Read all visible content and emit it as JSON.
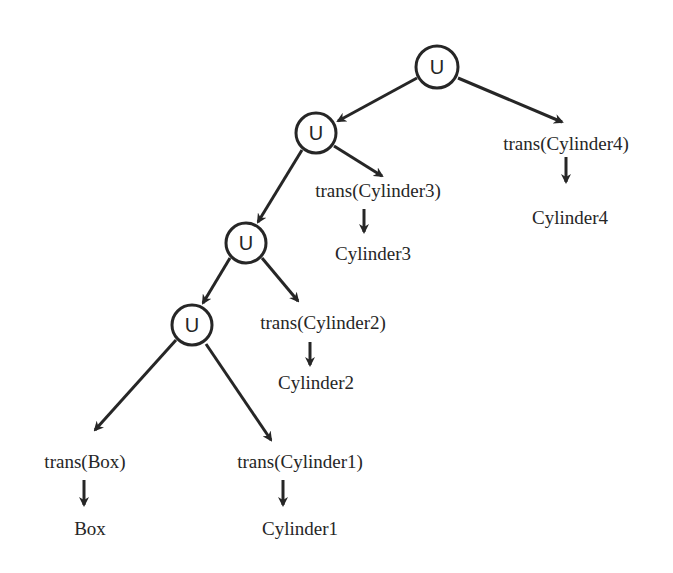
{
  "diagram": {
    "type": "csg-tree",
    "colors": {
      "stroke": "#262626",
      "background": "#ffffff"
    },
    "nodes": [
      {
        "id": "u1",
        "label": "U",
        "x": 437,
        "y": 67
      },
      {
        "id": "u2",
        "label": "U",
        "x": 316,
        "y": 133
      },
      {
        "id": "u3",
        "label": "U",
        "x": 246,
        "y": 243
      },
      {
        "id": "u4",
        "label": "U",
        "x": 192,
        "y": 325
      }
    ],
    "labels": {
      "trans_cyl4": "trans(Cylinder4)",
      "cyl4": "Cylinder4",
      "trans_cyl3": "trans(Cylinder3)",
      "cyl3": "Cylinder3",
      "trans_cyl2": "trans(Cylinder2)",
      "cyl2": "Cylinder2",
      "trans_box": "trans(Box)",
      "box": "Box",
      "trans_cyl1": "trans(Cylinder1)",
      "cyl1": "Cylinder1"
    },
    "edges": [
      [
        "u1",
        "u2"
      ],
      [
        "u1",
        "trans(Cylinder4)"
      ],
      [
        "u2",
        "u3"
      ],
      [
        "u2",
        "trans(Cylinder3)"
      ],
      [
        "u3",
        "u4"
      ],
      [
        "u3",
        "trans(Cylinder2)"
      ],
      [
        "u4",
        "trans(Box)"
      ],
      [
        "u4",
        "trans(Cylinder1)"
      ],
      [
        "trans(Cylinder4)",
        "Cylinder4"
      ],
      [
        "trans(Cylinder3)",
        "Cylinder3"
      ],
      [
        "trans(Cylinder2)",
        "Cylinder2"
      ],
      [
        "trans(Box)",
        "Box"
      ],
      [
        "trans(Cylinder1)",
        "Cylinder1"
      ]
    ]
  }
}
